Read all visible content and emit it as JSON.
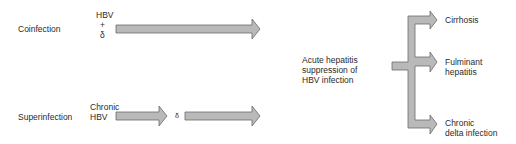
{
  "rows": {
    "coinfection": {
      "label": "Coinfection",
      "agents": [
        "HBV",
        "+",
        "δ"
      ]
    },
    "superinfection": {
      "label": "Superinfection",
      "agents": [
        "Chronic",
        "HBV"
      ],
      "intermediate": "δ"
    }
  },
  "center": {
    "lines": [
      "Acute hepatitis",
      "suppression of",
      "HBV infection"
    ]
  },
  "outcomes": [
    {
      "lines": [
        "Cirrhosis"
      ]
    },
    {
      "lines": [
        "Fulminant",
        "hepatitis"
      ]
    },
    {
      "lines": [
        "Chronic",
        "delta infection"
      ]
    }
  ],
  "colors": {
    "arrow_fill": "#b8b8b8",
    "arrow_stroke": "#6a6a6a",
    "text": "#2a2a2a"
  }
}
